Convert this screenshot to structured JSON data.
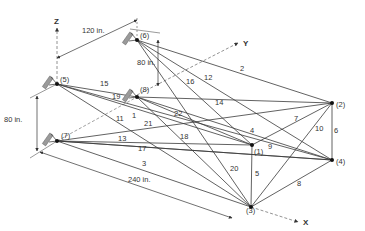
{
  "axes": {
    "x": {
      "label": "X",
      "from": [
        251,
        207
      ],
      "to": [
        298,
        222
      ]
    },
    "y": {
      "label": "Y",
      "from": [
        137,
        95
      ],
      "to": [
        238,
        43
      ]
    },
    "z": {
      "label": "Z",
      "from": [
        57,
        84
      ],
      "to": [
        57,
        28
      ]
    }
  },
  "nodes": [
    {
      "id": "1",
      "label": "(1)",
      "x": 252,
      "y": 145,
      "lx": 254,
      "ly": 154,
      "support": false
    },
    {
      "id": "2",
      "label": "(2)",
      "x": 332,
      "y": 103,
      "lx": 336,
      "ly": 107,
      "support": false
    },
    {
      "id": "3",
      "label": "(3)",
      "x": 251,
      "y": 207,
      "lx": 246,
      "ly": 213,
      "support": false
    },
    {
      "id": "4",
      "label": "(4)",
      "x": 332,
      "y": 160,
      "lx": 336,
      "ly": 164,
      "support": false
    },
    {
      "id": "5",
      "label": "(5)",
      "x": 57,
      "y": 84,
      "lx": 60,
      "ly": 82,
      "support": true
    },
    {
      "id": "6",
      "label": "(6)",
      "x": 137,
      "y": 40,
      "lx": 140,
      "ly": 38,
      "support": true
    },
    {
      "id": "7",
      "label": "(7)",
      "x": 57,
      "y": 141,
      "lx": 61,
      "ly": 138,
      "support": true
    },
    {
      "id": "8",
      "label": "(8)",
      "x": 137,
      "y": 97,
      "lx": 140,
      "ly": 92,
      "support": true
    }
  ],
  "members": [
    {
      "id": "1",
      "from": "8",
      "to": "1",
      "lx": 132,
      "ly": 118
    },
    {
      "id": "2",
      "from": "6",
      "to": "2",
      "lx": 240,
      "ly": 71
    },
    {
      "id": "3",
      "from": "7",
      "to": "3",
      "lx": 142,
      "ly": 166
    },
    {
      "id": "4",
      "from": "8",
      "to": "4",
      "lx": 250,
      "ly": 133
    },
    {
      "id": "5",
      "from": "1",
      "to": "3",
      "lx": 255,
      "ly": 176
    },
    {
      "id": "6",
      "from": "2",
      "to": "4",
      "lx": 334,
      "ly": 133
    },
    {
      "id": "7",
      "from": "1",
      "to": "2",
      "lx": 294,
      "ly": 121
    },
    {
      "id": "8",
      "from": "3",
      "to": "4",
      "lx": 297,
      "ly": 186
    },
    {
      "id": "9",
      "from": "7",
      "to": "4",
      "lx": 268,
      "ly": 149
    },
    {
      "id": "10",
      "from": "3",
      "to": "2",
      "lx": 315,
      "ly": 131
    },
    {
      "id": "11",
      "from": "5",
      "to": "3",
      "lx": 116,
      "ly": 121
    },
    {
      "id": "12",
      "from": "6",
      "to": "4",
      "lx": 204,
      "ly": 80
    },
    {
      "id": "13",
      "from": "7",
      "to": "1",
      "lx": 118,
      "ly": 141
    },
    {
      "id": "14",
      "from": "8",
      "to": "2",
      "lx": 215,
      "ly": 105
    },
    {
      "id": "15",
      "from": "5",
      "to": "8",
      "lx": 100,
      "ly": 86
    },
    {
      "id": "16",
      "from": "6",
      "to": "1",
      "lx": 186,
      "ly": 84
    },
    {
      "id": "17",
      "from": "7",
      "to": "4",
      "lx": 138,
      "ly": 151
    },
    {
      "id": "18",
      "from": "8",
      "to": "3",
      "lx": 180,
      "ly": 139
    },
    {
      "id": "19",
      "from": "5",
      "to": "1",
      "lx": 112,
      "ly": 99
    },
    {
      "id": "20",
      "from": "6",
      "to": "3",
      "lx": 230,
      "ly": 171
    },
    {
      "id": "21",
      "from": "7",
      "to": "2",
      "lx": 144,
      "ly": 126
    },
    {
      "id": "22",
      "from": "5",
      "to": "4",
      "lx": 174,
      "ly": 116
    }
  ],
  "dimensions": [
    {
      "id": "dim-120",
      "label": "120 in.",
      "x1": 57,
      "y1": 58,
      "x2": 137,
      "y2": 20,
      "lx": 82,
      "ly": 33
    },
    {
      "id": "dim-80-top",
      "label": "80 in.",
      "x1": 158,
      "y1": 40,
      "x2": 158,
      "y2": 86,
      "lx": 137,
      "ly": 65
    },
    {
      "id": "dim-80-left",
      "label": "80 in.",
      "x1": 37,
      "y1": 96,
      "x2": 37,
      "y2": 151,
      "lx": 4,
      "ly": 122
    },
    {
      "id": "dim-240",
      "label": "240 in.",
      "x1": 40,
      "y1": 152,
      "x2": 232,
      "y2": 218,
      "lx": 128,
      "ly": 182
    }
  ],
  "colors": {
    "line": "#3a3a3a",
    "axis": "#777777",
    "support": "#9a9a9a",
    "text": "#333333"
  }
}
